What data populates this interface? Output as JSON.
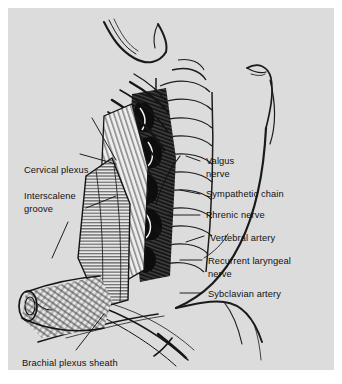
{
  "figure": {
    "background_color": "#dcdcdc",
    "ink_color": "#111111",
    "page_color": "#ffffff"
  },
  "labels_left": [
    {
      "id": "cervical-plexus",
      "text": "Cervical plexus",
      "x": 16,
      "y": 157
    },
    {
      "id": "interscalene-groove",
      "text": "Interscalene",
      "x": 16,
      "y": 183
    },
    {
      "id": "interscalene-groove-2",
      "text": "groove",
      "x": 16,
      "y": 196
    },
    {
      "id": "brachial-plexus-sheath",
      "text": "Brachial plexus sheath",
      "x": 14,
      "y": 350
    }
  ],
  "labels_right": [
    {
      "id": "valgus-nerve",
      "text": "Valgus",
      "x": 198,
      "y": 156
    },
    {
      "id": "valgus-nerve-2",
      "text": "nerve",
      "x": 198,
      "y": 169
    },
    {
      "id": "sympathetic-chain",
      "text": "Sympathetic chain",
      "x": 198,
      "y": 189
    },
    {
      "id": "phrenic-nerve",
      "text": "Phrenic nerve",
      "x": 198,
      "y": 210
    },
    {
      "id": "vertebral-artery",
      "text": "Vertebral artery",
      "x": 202,
      "y": 233
    },
    {
      "id": "recurrent-nerve",
      "text": "Recurrent laryngeal",
      "x": 200,
      "y": 256
    },
    {
      "id": "recurrent-nerve-2",
      "text": "nerve",
      "x": 200,
      "y": 269
    },
    {
      "id": "subclavian-artery",
      "text": "Sybclavian artery",
      "x": 200,
      "y": 289
    }
  ],
  "anatomy_parts": [
    "chin-outline",
    "jaw-outline",
    "ear-outline",
    "neck-contour",
    "trachea-rings",
    "scalene-muscle",
    "sternocleidomastoid",
    "clavicle-cut-end",
    "shoulder-contour",
    "vessel-bundle",
    "nerve-roots",
    "plexus-sheath"
  ]
}
